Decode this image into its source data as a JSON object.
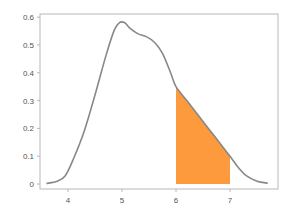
{
  "chart_data": {
    "type": "area",
    "title": "",
    "xlabel": "",
    "ylabel": "",
    "xlim": [
      3.5,
      7.85
    ],
    "ylim": [
      -0.012,
      0.62
    ],
    "grid": false,
    "legend": null,
    "x_ticks": [
      4,
      5,
      6,
      7
    ],
    "x_tick_labels": [
      "4",
      "5",
      "6",
      "7"
    ],
    "y_ticks": [
      0,
      0.1,
      0.2,
      0.3,
      0.4,
      0.5,
      0.6
    ],
    "y_tick_labels": [
      "0",
      "0.1",
      "0.2",
      "0.3",
      "0.4",
      "0.5",
      "0.6"
    ],
    "series": [
      {
        "name": "density",
        "color": "#888888",
        "x": [
          3.6,
          3.8,
          3.95,
          4.1,
          4.3,
          4.5,
          4.7,
          4.85,
          4.95,
          5.05,
          5.15,
          5.3,
          5.45,
          5.6,
          5.75,
          5.9,
          6.0,
          6.2,
          6.4,
          6.6,
          6.8,
          7.0,
          7.15,
          7.3,
          7.5,
          7.7
        ],
        "y": [
          0.002,
          0.01,
          0.03,
          0.09,
          0.19,
          0.32,
          0.46,
          0.55,
          0.58,
          0.58,
          0.56,
          0.54,
          0.53,
          0.51,
          0.47,
          0.4,
          0.35,
          0.3,
          0.25,
          0.2,
          0.15,
          0.1,
          0.06,
          0.03,
          0.01,
          0.003
        ]
      }
    ],
    "shaded_region": {
      "from": 6,
      "to": 7,
      "color": "#fd9a3e"
    }
  }
}
